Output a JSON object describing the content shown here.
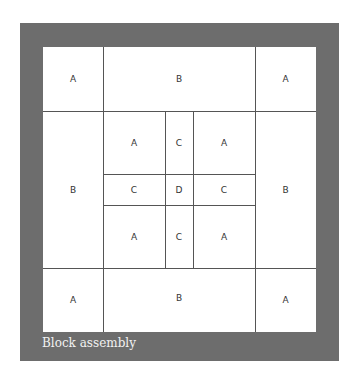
{
  "caption": "Block assembly",
  "colors": {
    "frame": "#6d6d6d",
    "panel": "#ffffff",
    "lines": "#555555"
  },
  "blocks": {
    "outer_top_left": "A",
    "outer_top_center": "B",
    "outer_top_right": "A",
    "outer_mid_left": "B",
    "outer_mid_right": "B",
    "outer_bottom_left": "A",
    "outer_bottom_center": "B",
    "outer_bottom_right": "A",
    "center_top_left": "A",
    "center_top_mid": "C",
    "center_top_right": "A",
    "center_mid_left": "C",
    "center_mid_mid": "D",
    "center_mid_right": "C",
    "center_bottom_left": "A",
    "center_bottom_mid": "C",
    "center_bottom_right": "A"
  }
}
